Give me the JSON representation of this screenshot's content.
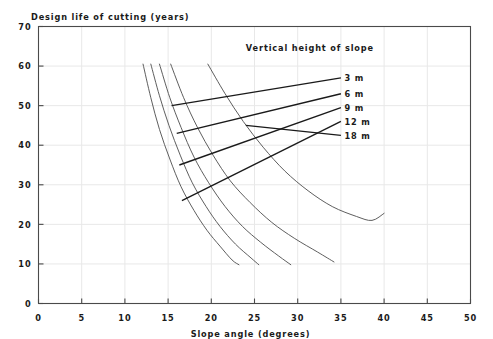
{
  "chart_data": {
    "type": "line",
    "title": "",
    "ylabel": "Design life of cutting (years)",
    "xlabel": "Slope angle (degrees)",
    "xlim": [
      0,
      50
    ],
    "ylim": [
      0,
      70
    ],
    "xticks": [
      "0",
      "5",
      "10",
      "15",
      "20",
      "25",
      "30",
      "35",
      "40",
      "45",
      "50"
    ],
    "yticks": [
      "0",
      "10",
      "20",
      "30",
      "40",
      "50",
      "60",
      "70"
    ],
    "xtick_values": [
      0,
      5,
      10,
      15,
      20,
      25,
      30,
      35,
      40,
      45,
      50
    ],
    "ytick_values": [
      0,
      10,
      20,
      30,
      40,
      50,
      60,
      70
    ],
    "grid": true,
    "legend_position": "inside-upper-right",
    "legend_title": "Vertical height of slope",
    "line_color": "#555555",
    "leader_color": "#1a1a1a",
    "grid_color": "#e8e8e8",
    "axis_color": "#4a4a4a",
    "series": [
      {
        "name": "3 m",
        "label": "3 m",
        "points": [
          [
            12.1,
            60.5
          ],
          [
            13.0,
            52.0
          ],
          [
            14.0,
            44.0
          ],
          [
            15.2,
            36.5
          ],
          [
            16.5,
            29.5
          ],
          [
            18.0,
            23.5
          ],
          [
            19.5,
            18.5
          ],
          [
            21.0,
            14.5
          ],
          [
            22.4,
            11.0
          ],
          [
            23.2,
            9.8
          ]
        ],
        "leader_from": [
          15.4,
          50.0
        ],
        "leader_to": [
          35.0,
          57.0
        ]
      },
      {
        "name": "6 m",
        "label": "6 m",
        "points": [
          [
            13.0,
            60.5
          ],
          [
            14.0,
            52.5
          ],
          [
            15.1,
            45.0
          ],
          [
            16.4,
            37.5
          ],
          [
            17.8,
            30.5
          ],
          [
            19.4,
            24.5
          ],
          [
            21.0,
            19.5
          ],
          [
            22.8,
            15.0
          ],
          [
            24.6,
            11.5
          ],
          [
            25.5,
            9.8
          ]
        ],
        "leader_from": [
          16.0,
          43.0
        ],
        "leader_to": [
          35.0,
          53.0
        ]
      },
      {
        "name": "9 m",
        "label": "9 m",
        "points": [
          [
            14.0,
            60.5
          ],
          [
            15.2,
            52.0
          ],
          [
            16.5,
            44.5
          ],
          [
            18.0,
            37.0
          ],
          [
            19.7,
            30.5
          ],
          [
            21.6,
            24.5
          ],
          [
            23.6,
            19.5
          ],
          [
            25.7,
            15.5
          ],
          [
            27.8,
            12.0
          ],
          [
            29.2,
            9.8
          ]
        ],
        "leader_from": [
          16.3,
          35.0
        ],
        "leader_to": [
          35.0,
          49.5
        ]
      },
      {
        "name": "12 m",
        "label": "12 m",
        "points": [
          [
            15.3,
            60.5
          ],
          [
            16.8,
            52.0
          ],
          [
            18.4,
            44.5
          ],
          [
            20.2,
            37.5
          ],
          [
            22.2,
            31.0
          ],
          [
            24.5,
            25.5
          ],
          [
            27.0,
            20.5
          ],
          [
            29.6,
            16.5
          ],
          [
            32.3,
            13.0
          ],
          [
            34.2,
            10.5
          ]
        ],
        "leader_from": [
          16.6,
          26.0
        ],
        "leader_to": [
          35.0,
          46.0
        ]
      },
      {
        "name": "18 m",
        "label": "18 m",
        "points": [
          [
            19.6,
            60.5
          ],
          [
            21.6,
            53.0
          ],
          [
            23.7,
            46.0
          ],
          [
            26.0,
            39.5
          ],
          [
            28.5,
            33.5
          ],
          [
            31.2,
            28.5
          ],
          [
            34.0,
            24.5
          ],
          [
            36.8,
            22.0
          ],
          [
            38.6,
            21.0
          ],
          [
            40.0,
            22.8
          ]
        ],
        "leader_from": [
          24.0,
          45.0
        ],
        "leader_to": [
          35.0,
          42.5
        ]
      }
    ]
  }
}
